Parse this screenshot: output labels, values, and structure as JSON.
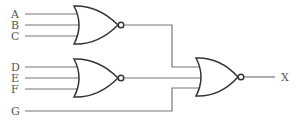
{
  "diagram": {
    "type": "logic-circuit",
    "inputs": [
      {
        "label": "A",
        "y": 14
      },
      {
        "label": "B",
        "y": 25
      },
      {
        "label": "C",
        "y": 36
      },
      {
        "label": "D",
        "y": 67
      },
      {
        "label": "E",
        "y": 78
      },
      {
        "label": "F",
        "y": 89
      },
      {
        "label": "G",
        "y": 111
      }
    ],
    "gates": [
      {
        "id": "nor1",
        "type": "NOR",
        "inputs": [
          "A",
          "B",
          "C"
        ]
      },
      {
        "id": "nor2",
        "type": "NOR",
        "inputs": [
          "D",
          "E",
          "F"
        ]
      },
      {
        "id": "nor3",
        "type": "NOR",
        "inputs": [
          "nor1",
          "nor2",
          "G"
        ]
      }
    ],
    "output": {
      "label": "X"
    }
  }
}
